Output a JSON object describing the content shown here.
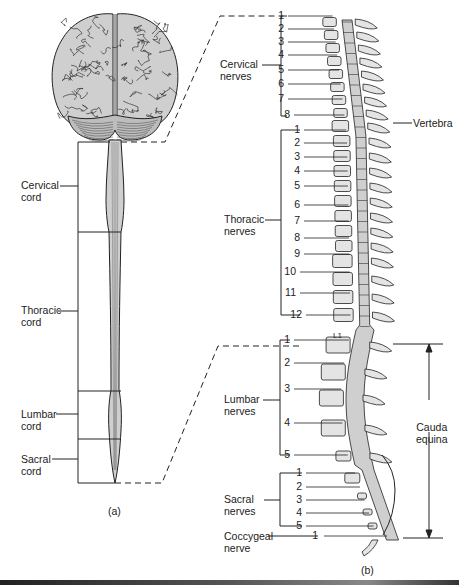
{
  "figure": {
    "panel_a_caption": "(a)",
    "panel_b_caption": "(b)"
  },
  "panel_a": {
    "structures": [
      "brain",
      "cerebellum",
      "spinal cord"
    ],
    "cord_regions": [
      {
        "label_line1": "Cervical",
        "label_line2": "cord",
        "label_y": 185
      },
      {
        "label_line1": "Thoracic",
        "label_line2": "cord",
        "label_y": 310
      },
      {
        "label_line1": "Lumbar",
        "label_line2": "cord",
        "label_y": 414
      },
      {
        "label_line1": "Sacral",
        "label_line2": "cord",
        "label_y": 460
      }
    ]
  },
  "panel_b": {
    "nerve_groups": [
      {
        "label_line1": "Cervical",
        "label_line2": "nerves",
        "numbers": [
          "1",
          "2",
          "3",
          "4",
          "5",
          "6",
          "7",
          "8"
        ]
      },
      {
        "label_line1": "Thoracic",
        "label_line2": "nerves",
        "numbers": [
          "1",
          "2",
          "3",
          "4",
          "5",
          "6",
          "7",
          "8",
          "9",
          "10",
          "11",
          "12"
        ]
      },
      {
        "label_line1": "Lumbar",
        "label_line2": "nerves",
        "numbers": [
          "1",
          "2",
          "3",
          "4",
          "5"
        ]
      },
      {
        "label_line1": "Sacral",
        "label_line2": "nerves",
        "numbers": [
          "1",
          "2",
          "3",
          "4",
          "5"
        ]
      },
      {
        "label_line1": "Coccygeal",
        "label_line2": "nerve",
        "numbers": [
          "1"
        ]
      }
    ],
    "vertebra_label": "Vertebra",
    "cauda_equina_line1": "Cauda",
    "cauda_equina_line2": "equina",
    "l1_label": "L1",
    "cord_segment_numbers": [
      "1",
      "2",
      "3",
      "4",
      "5",
      "6",
      "7",
      "8",
      "1",
      "2",
      "3",
      "4",
      "5",
      "6",
      "7",
      "8",
      "9",
      "10",
      "11",
      "12",
      "1",
      "2",
      "3",
      "4",
      "5",
      "1",
      "2",
      "3",
      "4",
      "5"
    ]
  },
  "colors": {
    "fill_gray": "#cfcfcf",
    "line": "#222222",
    "background": "#ffffff"
  }
}
